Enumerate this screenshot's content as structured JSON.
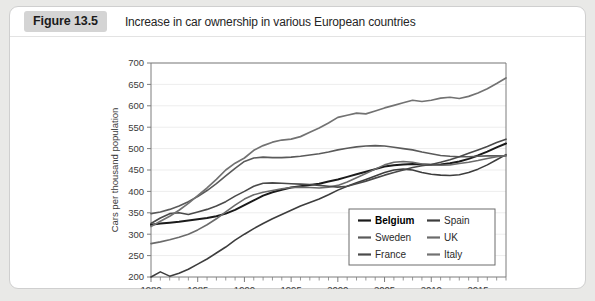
{
  "figure": {
    "badge": "Figure 13.5",
    "caption": "Increase in car ownership in various European countries"
  },
  "chart_data": {
    "type": "line",
    "title": "Increase in car ownership in various European countries",
    "xlabel": "",
    "ylabel": "Cars per thousand population",
    "xlim": [
      1980,
      2018
    ],
    "ylim": [
      200,
      700
    ],
    "ytick_step": 50,
    "yticks": [
      200,
      250,
      300,
      350,
      400,
      450,
      500,
      550,
      600,
      650,
      700
    ],
    "xticks": [
      1980,
      1985,
      1990,
      1995,
      2000,
      2005,
      2010,
      2015
    ],
    "xtick_minor_step": 1,
    "grid": true,
    "legend_position": "lower right",
    "x": [
      1980,
      1981,
      1982,
      1983,
      1984,
      1985,
      1986,
      1987,
      1988,
      1989,
      1990,
      1991,
      1992,
      1993,
      1994,
      1995,
      1996,
      1997,
      1998,
      1999,
      2000,
      2001,
      2002,
      2003,
      2004,
      2005,
      2006,
      2007,
      2008,
      2009,
      2010,
      2011,
      2012,
      2013,
      2014,
      2015,
      2016,
      2017,
      2018
    ],
    "series": [
      {
        "name": "Belgium",
        "color": "#1a1a1a",
        "width": 2.0,
        "values": [
          322,
          325,
          327,
          329,
          332,
          335,
          338,
          342,
          348,
          357,
          368,
          379,
          390,
          398,
          404,
          409,
          412,
          415,
          418,
          423,
          428,
          434,
          440,
          446,
          452,
          458,
          461,
          463,
          464,
          463,
          462,
          463,
          466,
          470,
          476,
          484,
          493,
          503,
          512
        ]
      },
      {
        "name": "Spain",
        "color": "#3d3d3d",
        "width": 1.6,
        "values": [
          200,
          212,
          202,
          209,
          218,
          230,
          242,
          256,
          270,
          286,
          300,
          313,
          325,
          336,
          346,
          356,
          366,
          374,
          382,
          392,
          403,
          412,
          420,
          428,
          436,
          444,
          450,
          452,
          450,
          444,
          440,
          438,
          437,
          439,
          444,
          452,
          462,
          474,
          486
        ]
      },
      {
        "name": "Sweden",
        "color": "#5a5a5a",
        "width": 1.6,
        "values": [
          348,
          352,
          358,
          366,
          376,
          388,
          402,
          418,
          436,
          454,
          470,
          478,
          480,
          479,
          479,
          480,
          482,
          485,
          488,
          492,
          497,
          501,
          504,
          506,
          507,
          506,
          503,
          500,
          497,
          492,
          488,
          484,
          482,
          481,
          481,
          482,
          483,
          483,
          483
        ]
      },
      {
        "name": "UK",
        "color": "#6b6b6b",
        "width": 1.6,
        "values": [
          278,
          282,
          287,
          293,
          300,
          310,
          322,
          336,
          352,
          368,
          382,
          392,
          398,
          402,
          406,
          409,
          410,
          409,
          408,
          410,
          414,
          422,
          432,
          442,
          452,
          462,
          468,
          470,
          468,
          464,
          462,
          461,
          462,
          465,
          468,
          472,
          477,
          481,
          484
        ]
      },
      {
        "name": "France",
        "color": "#4a4a4a",
        "width": 1.6,
        "values": [
          325,
          338,
          348,
          350,
          346,
          352,
          358,
          366,
          376,
          389,
          400,
          412,
          419,
          420,
          419,
          418,
          417,
          416,
          414,
          412,
          410,
          412,
          418,
          424,
          431,
          438,
          444,
          450,
          456,
          460,
          463,
          468,
          474,
          481,
          489,
          497,
          505,
          514,
          522
        ]
      },
      {
        "name": "Italy",
        "color": "#727272",
        "width": 1.7,
        "values": [
          318,
          330,
          342,
          356,
          372,
          390,
          408,
          428,
          450,
          466,
          478,
          496,
          507,
          515,
          520,
          522,
          528,
          538,
          548,
          560,
          573,
          578,
          583,
          581,
          588,
          595,
          601,
          607,
          613,
          610,
          613,
          618,
          620,
          617,
          622,
          630,
          640,
          652,
          665
        ]
      }
    ],
    "legend_entries": [
      {
        "name": "Belgium",
        "bold": true
      },
      {
        "name": "Spain",
        "bold": false
      },
      {
        "name": "Sweden",
        "bold": false
      },
      {
        "name": "UK",
        "bold": false
      },
      {
        "name": "France",
        "bold": false
      },
      {
        "name": "Italy",
        "bold": false
      }
    ]
  }
}
